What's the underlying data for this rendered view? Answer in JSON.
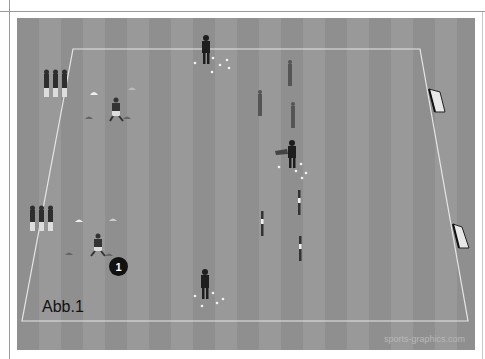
{
  "figure": {
    "caption": "Abb.1",
    "watermark": "sports-graphics.com",
    "marker_label": "1"
  },
  "colors": {
    "pitch_light": "#999999",
    "pitch_dark": "#8f8f8f",
    "lines": "#e6e6e6",
    "players": "#2a2a2a",
    "marker": "#111111"
  },
  "elements": {
    "player_groups": [
      {
        "name": "waiting-group-top",
        "count": 3
      },
      {
        "name": "waiting-group-bottom",
        "count": 3
      }
    ],
    "coaches": 3,
    "mannequins": 4,
    "poles": 4,
    "goals": 2,
    "cones": 6
  }
}
